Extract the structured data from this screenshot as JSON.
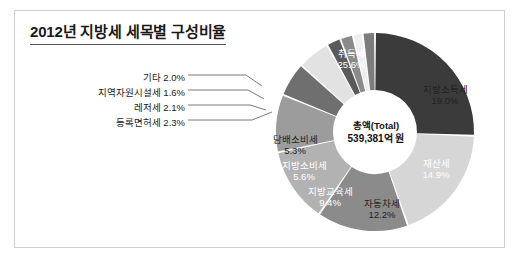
{
  "figure": {
    "title": "2012년 지방세 세목별 구성비율",
    "center_total_label": "총액(Total)",
    "center_total_value": "539,381억 원",
    "frame_border_color": "#cfcfcf",
    "background_color": "#ffffff"
  },
  "chart_data": {
    "type": "pie",
    "variant": "donut",
    "title": "2012년 지방세 세목별 구성비율",
    "unit": "%",
    "total_label": "총액(Total)",
    "total_value": "539,381억 원",
    "legend": "none",
    "start_angle_deg": 0,
    "direction": "clockwise",
    "categories": [
      "취득세",
      "지방소득세",
      "재산세",
      "자동차세",
      "지방교육세",
      "지방소비세",
      "담배소비세",
      "등록면허세",
      "레저세",
      "지역자원시설세",
      "기타"
    ],
    "values": [
      25.6,
      19.0,
      14.9,
      12.2,
      9.4,
      5.6,
      5.3,
      2.3,
      2.1,
      1.6,
      2.0
    ],
    "colors": [
      "#3b3b3b",
      "#d6d6d6",
      "#8b8b8b",
      "#b2b2b2",
      "#9c9c9c",
      "#6f6f6f",
      "#e2e2e2",
      "#5a5a5a",
      "#8b8b8b",
      "#efefef",
      "#7c7c7c"
    ],
    "slices": [
      {
        "name": "취득세",
        "value": 25.6,
        "label": "취득세",
        "pct": "25.6%",
        "color": "#3b3b3b",
        "text_color": "light",
        "label_placement": "inside"
      },
      {
        "name": "지방소득세",
        "value": 19.0,
        "label": "지방소득세",
        "pct": "19.0%",
        "color": "#d6d6d6",
        "text_color": "dark",
        "label_placement": "inside"
      },
      {
        "name": "재산세",
        "value": 14.9,
        "label": "재산세",
        "pct": "14.9%",
        "color": "#8b8b8b",
        "text_color": "light",
        "label_placement": "inside"
      },
      {
        "name": "자동차세",
        "value": 12.2,
        "label": "자동차세",
        "pct": "12.2%",
        "color": "#b2b2b2",
        "text_color": "dark",
        "label_placement": "inside"
      },
      {
        "name": "지방교육세",
        "value": 9.4,
        "label": "지방교육세",
        "pct": "9.4%",
        "color": "#9c9c9c",
        "text_color": "light",
        "label_placement": "inside"
      },
      {
        "name": "지방소비세",
        "value": 5.6,
        "label": "지방소비세",
        "pct": "5.6%",
        "color": "#6f6f6f",
        "text_color": "light",
        "label_placement": "inside"
      },
      {
        "name": "담배소비세",
        "value": 5.3,
        "label": "담배소비세",
        "pct": "5.3%",
        "color": "#e2e2e2",
        "text_color": "dark",
        "label_placement": "inside"
      },
      {
        "name": "등록면허세",
        "value": 2.3,
        "label": "등록면허세 2.3%",
        "pct": "2.3%",
        "color": "#5a5a5a",
        "text_color": "dark",
        "label_placement": "callout"
      },
      {
        "name": "레저세",
        "value": 2.1,
        "label": "레저세 2.1%",
        "pct": "2.1%",
        "color": "#8b8b8b",
        "text_color": "dark",
        "label_placement": "callout"
      },
      {
        "name": "지역자원시설세",
        "value": 1.6,
        "label": "지역자원시설세 1.6%",
        "pct": "1.6%",
        "color": "#efefef",
        "text_color": "dark",
        "label_placement": "callout"
      },
      {
        "name": "기타",
        "value": 2.0,
        "label": "기타 2.0%",
        "pct": "2.0%",
        "color": "#7c7c7c",
        "text_color": "dark",
        "label_placement": "callout"
      }
    ]
  },
  "inside_labels": [
    {
      "name": "취득세",
      "pct": "25.6%"
    },
    {
      "name": "지방소득세",
      "pct": "19.0%"
    },
    {
      "name": "재산세",
      "pct": "14.9%"
    },
    {
      "name": "자동차세",
      "pct": "12.2%"
    },
    {
      "name": "지방교육세",
      "pct": "9.4%"
    },
    {
      "name": "지방소비세",
      "pct": "5.6%"
    },
    {
      "name": "담배소비세",
      "pct": "5.3%"
    }
  ],
  "callout_labels": [
    {
      "text": "기타 2.0%"
    },
    {
      "text": "지역자원시설세 1.6%"
    },
    {
      "text": "레저세 2.1%"
    },
    {
      "text": "등록면허세 2.3%"
    }
  ]
}
